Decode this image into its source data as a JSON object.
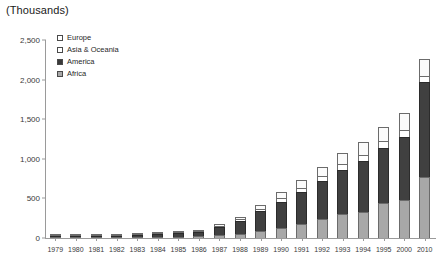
{
  "chart_data": {
    "type": "bar",
    "subtype": "stacked-column",
    "title": "(Thousands)",
    "xlabel": "",
    "ylabel": "",
    "ylim": [
      0,
      2500
    ],
    "yticks": [
      0,
      500,
      1000,
      1500,
      2000,
      2500
    ],
    "ytick_labels": [
      "0",
      "500",
      "1,000",
      "1,500",
      "2,000",
      "2,500"
    ],
    "grid": false,
    "legend_position": "top-left-inside",
    "stack_order_bottom_to_top": [
      "Africa",
      "America",
      "Asia & Oceania",
      "Europe"
    ],
    "categories": [
      "1979",
      "1980",
      "1981",
      "1982",
      "1983",
      "1984",
      "1985",
      "1986",
      "1987",
      "1988",
      "1989",
      "1990",
      "1991",
      "1992",
      "1993",
      "1994",
      "1995",
      "2000",
      "2010"
    ],
    "series": [
      {
        "name": "Africa",
        "color": "#a8a8a8",
        "values": [
          2,
          3,
          4,
          5,
          8,
          12,
          16,
          22,
          35,
          55,
          85,
          130,
          180,
          240,
          300,
          330,
          440,
          480,
          770
        ]
      },
      {
        "name": "America",
        "color": "#404040",
        "values": [
          4,
          6,
          8,
          11,
          22,
          33,
          44,
          58,
          105,
          160,
          250,
          330,
          400,
          480,
          560,
          640,
          700,
          800,
          1200
        ]
      },
      {
        "name": "Asia & Oceania",
        "color": "#ffffff",
        "values": [
          1,
          1,
          2,
          2,
          4,
          5,
          7,
          9,
          15,
          20,
          30,
          40,
          50,
          60,
          70,
          80,
          85,
          90,
          80
        ]
      },
      {
        "name": "Europe",
        "color": "#fbfbfb",
        "values": [
          1,
          2,
          2,
          3,
          6,
          8,
          10,
          13,
          25,
          35,
          55,
          80,
          100,
          120,
          140,
          160,
          180,
          210,
          210
        ]
      }
    ],
    "totals": [
      8,
      12,
      16,
      21,
      40,
      58,
      77,
      102,
      180,
      270,
      420,
      580,
      730,
      900,
      1070,
      1210,
      1405,
      1580,
      2260
    ]
  },
  "legend": {
    "items": [
      {
        "label": "Europe",
        "swatch": "legend-swatch-europe"
      },
      {
        "label": "Asia & Oceania",
        "swatch": "legend-swatch-asia-oceania"
      },
      {
        "label": "America",
        "swatch": "legend-swatch-america"
      },
      {
        "label": "Africa",
        "swatch": "legend-swatch-africa"
      }
    ]
  }
}
